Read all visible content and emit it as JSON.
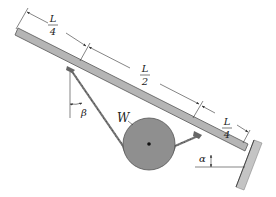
{
  "diagram": {
    "type": "statics-free-body",
    "labels": {
      "weight": "W",
      "angle_rope": "β",
      "angle_beam": "α"
    },
    "dimensions": [
      {
        "num": "L",
        "den": "4"
      },
      {
        "num": "L",
        "den": "2"
      },
      {
        "num": "L",
        "den": "4"
      }
    ],
    "colors": {
      "beam_fill": "#b5b5b5",
      "beam_stroke": "#555555",
      "pulley_fill": "#8f8f8f",
      "wall_fill": "#c4c4c4",
      "line": "#333333"
    }
  }
}
